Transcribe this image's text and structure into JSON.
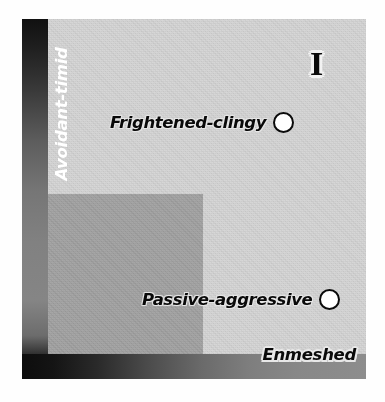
{
  "figure": {
    "quadrant_numeral": "I",
    "axes": {
      "vertical_label": "Avoidant-timid",
      "horizontal_label": "Enmeshed"
    },
    "points": [
      {
        "label": "Frightened-clingy",
        "marker": "open-circle"
      },
      {
        "label": "Passive-aggressive",
        "marker": "open-circle"
      }
    ],
    "colors": {
      "plot_background": "#d5d5d5",
      "inner_block": "#a2a2a2",
      "axis_bar_dark": "#0d0d0d",
      "axis_bar_light": "#8d8d8d",
      "marker_fill": "#ffffff",
      "marker_stroke": "#0b0b0b",
      "label_text_dark": "#0a0a0a",
      "label_text_light": "#ffffff"
    }
  }
}
